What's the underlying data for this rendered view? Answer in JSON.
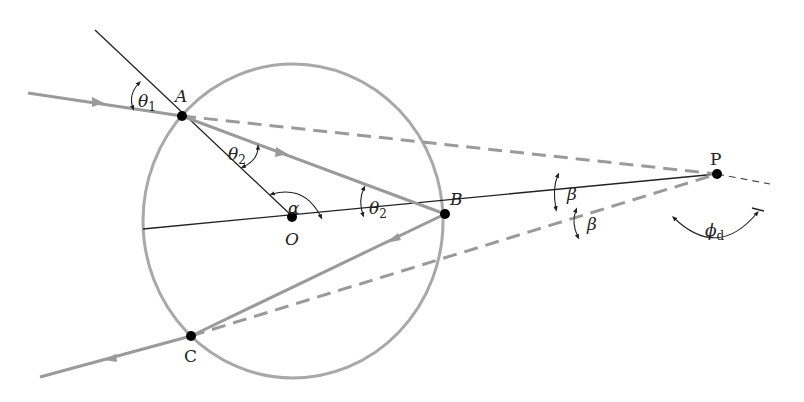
{
  "diagram": {
    "type": "rainbow-ray-geometry",
    "points": {
      "A": {
        "label": "A"
      },
      "B": {
        "label": "B"
      },
      "C": {
        "label": "C"
      },
      "O": {
        "label": "O"
      },
      "P": {
        "label": "P"
      }
    },
    "angles": {
      "theta1": {
        "symbol": "θ",
        "sub": "1"
      },
      "theta2_at_A": {
        "symbol": "θ",
        "sub": "2"
      },
      "theta2_at_B": {
        "symbol": "θ",
        "sub": "2"
      },
      "alpha": {
        "symbol": "α"
      },
      "beta_upper": {
        "symbol": "β"
      },
      "beta_lower": {
        "symbol": "β"
      },
      "phi_d": {
        "symbol": "ϕ",
        "sub": "d"
      }
    },
    "colors": {
      "ray": "#9a9a9a",
      "circle": "#a8a8a8",
      "line": "#222222",
      "dashed": "#9a9a9a",
      "dot": "#000000"
    }
  }
}
